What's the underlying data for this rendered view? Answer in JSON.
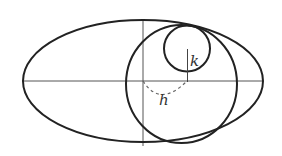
{
  "diagram": {
    "labels": {
      "k": "k",
      "h": "h"
    },
    "colors": {
      "outline": "#222222",
      "axis": "#555555",
      "dashed": "#666666",
      "background": "#ffffff"
    }
  }
}
